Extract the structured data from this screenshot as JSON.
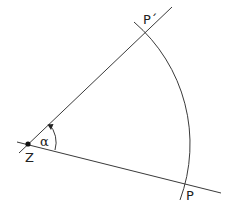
{
  "diagram": {
    "type": "rotation",
    "labels": {
      "center": "Z",
      "point": "P",
      "image_point": "P´",
      "angle": "α"
    },
    "colors": {
      "stroke": "#3a3a3a",
      "text": "#222222",
      "background": "#ffffff"
    }
  }
}
